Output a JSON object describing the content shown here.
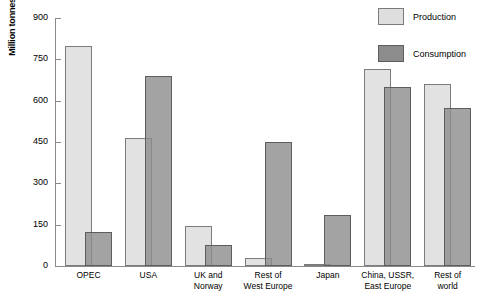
{
  "chart_data": {
    "type": "bar",
    "title": "",
    "xlabel": "",
    "ylabel": "Million tonnes",
    "ylim": [
      0,
      900
    ],
    "yticks": [
      0,
      150,
      300,
      450,
      600,
      750,
      900
    ],
    "ytick_labels": [
      "0",
      "150",
      "300",
      "450",
      "600",
      "750",
      "900"
    ],
    "grid": false,
    "legend_position": "top-right",
    "overlap_style": "overlapping semi-transparent pairs",
    "categories": [
      "OPEC",
      "USA",
      "UK and\nNorway",
      "Rest of\nWest Europe",
      "Japan",
      "China, USSR,\nEast Europe",
      "Rest of\nworld"
    ],
    "series": [
      {
        "name": "Production",
        "color": "#dedede",
        "values": [
          800,
          465,
          145,
          30,
          8,
          715,
          660
        ]
      },
      {
        "name": "Consumption",
        "color": "#8c8c8c",
        "values": [
          125,
          690,
          75,
          450,
          185,
          650,
          575
        ]
      }
    ]
  },
  "legend": {
    "items": [
      {
        "label": "Production",
        "swatch": "production"
      },
      {
        "label": "Consumption",
        "swatch": "consumption"
      }
    ]
  }
}
